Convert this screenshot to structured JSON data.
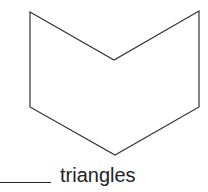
{
  "figure": {
    "shape": "hexagon (chevron-shaped)",
    "vertices": [
      [
        30,
        12
      ],
      [
        114,
        60
      ],
      [
        199,
        11
      ],
      [
        199,
        107
      ],
      [
        115,
        155
      ],
      [
        30,
        107
      ]
    ],
    "stroke_color": "#333333"
  },
  "prompt": {
    "blank": "",
    "label": "triangles"
  }
}
